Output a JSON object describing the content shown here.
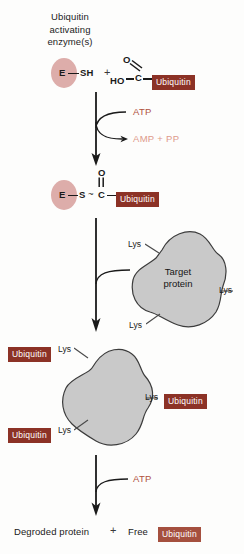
{
  "diagram": {
    "background": "#fdfdfc",
    "colors": {
      "ubiquitin_box": "#8c3226",
      "ubiquitin_box_light": "#a5503f",
      "enzyme_ellipse": "#ddadaa",
      "protein_blob": "#c9c9c9",
      "atp_text": "#b0503c",
      "amp_text": "#dd9a8b",
      "line": "#1a1a1a"
    }
  },
  "step1": {
    "caption_line1": "Ubiquitin",
    "caption_line2": "activating",
    "caption_line3": "enzyme(s)",
    "enzyme_letter": "E",
    "thiol_label": "SH",
    "plus": "+",
    "carboxyl_o": "O",
    "carboxyl_ho": "HO",
    "carboxyl_c": "C",
    "ubiquitin_label": "Ubiquitin"
  },
  "reaction1": {
    "input": "ATP",
    "output": "AMP  +  PP"
  },
  "step2": {
    "enzyme_letter": "E",
    "sulfur": "S",
    "thioester_bond": "~",
    "carbon": "C",
    "carbonyl_o": "O",
    "ubiquitin_label": "Ubiquitin"
  },
  "step3": {
    "blob_line1": "Target",
    "blob_line2": "protein",
    "lys_top": "Lys",
    "lys_right": "Lys",
    "lys_bottom": "Lys"
  },
  "step4": {
    "lys_top": "Lys",
    "lys_right": "Lys",
    "lys_bottom": "Lys",
    "ubiquitin_top": "Ubiquitin",
    "ubiquitin_right": "Ubiquitin",
    "ubiquitin_bottom": "Ubiquitin"
  },
  "reaction2": {
    "input": "ATP"
  },
  "step5": {
    "degraded_protein": "Degroded protein",
    "plus": "+",
    "free": "Free",
    "ubiquitin_label": "Ubiquitin"
  }
}
